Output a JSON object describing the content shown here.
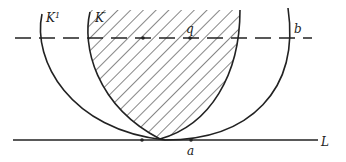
{
  "diagram": {
    "labels": {
      "k_outer": "K",
      "k_outer_sup": "1",
      "k_inner": "K",
      "k_inner_sup": "′",
      "point_q": "q",
      "line_b": "b",
      "point_a": "a",
      "line_L": "L"
    },
    "colors": {
      "ink": "#222222",
      "background": "#ffffff"
    }
  }
}
